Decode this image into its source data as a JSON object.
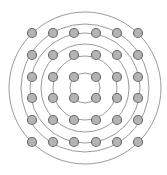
{
  "diagram": {
    "type": "concentric-circles-over-dot-grid",
    "center": [
      85,
      88
    ],
    "colors": {
      "background": "#ffffff",
      "circle_stroke": "#9a9a9a",
      "dot_fill": "#b4b4b4",
      "dot_stroke": "#6e6e6e"
    },
    "circles": [
      {
        "r": 76
      },
      {
        "r": 64
      },
      {
        "r": 55
      },
      {
        "r": 44
      },
      {
        "r": 32
      },
      {
        "r": 15
      }
    ],
    "grid": {
      "columns_x": [
        32,
        53,
        74,
        96,
        117,
        138
      ],
      "rows_y": [
        33,
        55,
        77,
        98,
        120,
        142
      ],
      "dot_radius": 4.5
    }
  }
}
